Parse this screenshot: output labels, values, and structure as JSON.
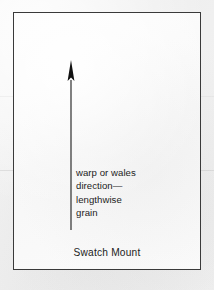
{
  "figure": {
    "name": "swatch-mount-grain-direction-diagram",
    "caption": "Swatch Mount"
  },
  "mount": {
    "border_color": "#3a3a3a",
    "fill_color": "#fbfbfb"
  },
  "arrow": {
    "name": "grain-direction-arrow",
    "direction": "up",
    "color": "#1a1a1a"
  },
  "annotation": {
    "lines": [
      "warp or wales",
      "direction—",
      "lengthwise",
      "grain"
    ]
  },
  "page": {
    "background_color": "#f2f2f2",
    "text_color": "#1c1c1c"
  }
}
